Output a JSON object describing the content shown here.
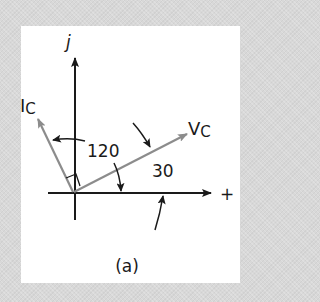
{
  "diagram": {
    "caption": "(a)",
    "axes": {
      "imaginary_label": "j",
      "real_label": "+"
    },
    "phasors": [
      {
        "name": "I",
        "subscript": "C",
        "angle_deg": 120,
        "color": "#8c8c8c"
      },
      {
        "name": "V",
        "subscript": "C",
        "angle_deg": 30,
        "color": "#8c8c8c"
      }
    ],
    "angle_labels": {
      "current_angle": "120",
      "voltage_angle": "30"
    },
    "colors": {
      "background": "#d8d8d8",
      "panel": "#ffffff",
      "axis": "#1a1a1a",
      "phasor": "#8c8c8c"
    },
    "annotations": {
      "right_angle_marker": true
    }
  }
}
